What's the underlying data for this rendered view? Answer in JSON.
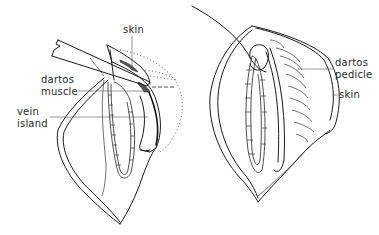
{
  "figure": {
    "panels": [
      {
        "id": "left",
        "description": "Flap retracted with forceps showing vein island and dartos muscle layer",
        "labels": {
          "skin": "skin",
          "dartos_line1": "dartos",
          "dartos_line2": "muscle",
          "vein_line1": "vein",
          "vein_line2": "island"
        }
      },
      {
        "id": "right",
        "description": "Dartos pedicle flap rotated over sutured repair with needle",
        "labels": {
          "dartos_line1": "dartos",
          "dartos_line2": "pedicle",
          "skin": "skin"
        }
      }
    ],
    "colors": {
      "line": "#1a1a1a",
      "text": "#2a2a2a",
      "background": "#ffffff"
    }
  }
}
